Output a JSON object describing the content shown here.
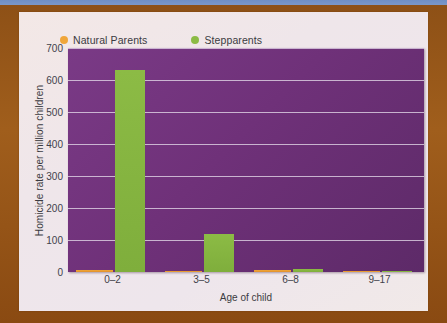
{
  "legend": {
    "items": [
      {
        "label": "Natural Parents",
        "color": "#f0a63a",
        "icon": "legend-dot-icon"
      },
      {
        "label": "Stepparents",
        "color": "#8cbb45",
        "icon": "legend-dot-icon"
      }
    ]
  },
  "chart_data": {
    "type": "bar",
    "title": "",
    "xlabel": "Age of child",
    "ylabel": "Homicide rate per million children",
    "categories": [
      "0–2",
      "3–5",
      "6–8",
      "9–17"
    ],
    "series": [
      {
        "name": "Natural Parents",
        "color": "#f0a63a",
        "values": [
          7,
          3,
          5,
          1
        ]
      },
      {
        "name": "Stepparents",
        "color": "#8cbb45",
        "values": [
          630,
          120,
          9,
          3
        ]
      }
    ],
    "ylim": [
      0,
      700
    ],
    "yticks": [
      0,
      100,
      200,
      300,
      400,
      500,
      600,
      700
    ],
    "ytick_labels": [
      "0",
      "100",
      "200",
      "300",
      "400",
      "500",
      "600",
      "700"
    ],
    "grid": true,
    "legend_position": "top-left",
    "plot_background": "#6f3179"
  }
}
